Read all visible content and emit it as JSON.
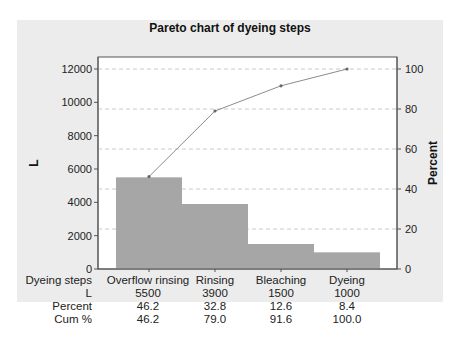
{
  "chart_data": {
    "type": "bar",
    "title": "Pareto chart of dyeing steps",
    "xlabel": "Dyeing steps",
    "ylabel": "L",
    "y2label": "Percent",
    "categories": [
      "Overflow rinsing",
      "Rinsing",
      "Bleaching",
      "Dyeing"
    ],
    "series": [
      {
        "name": "L",
        "type": "bar",
        "values": [
          5500,
          3900,
          1500,
          1000
        ]
      },
      {
        "name": "Cum %",
        "type": "line",
        "axis": "right",
        "values": [
          46.2,
          79.0,
          91.6,
          100.0
        ]
      }
    ],
    "ylim": [
      0,
      12000
    ],
    "y2lim": [
      0,
      100
    ],
    "yticks": [
      "0",
      "2000",
      "4000",
      "6000",
      "8000",
      "10000",
      "12000"
    ],
    "y2ticks": [
      "0",
      "20",
      "40",
      "60",
      "80",
      "100"
    ],
    "grid": "dashed horizontal at right-axis ticks",
    "table": {
      "row_headers": [
        "Dyeing steps",
        "L",
        "Percent",
        "Cum %"
      ],
      "rows": [
        [
          "Overflow rinsing",
          "Rinsing",
          "Bleaching",
          "Dyeing"
        ],
        [
          "5500",
          "3900",
          "1500",
          "1000"
        ],
        [
          "46.2",
          "32.8",
          "12.6",
          "8.4"
        ],
        [
          "46.2",
          "79.0",
          "91.6",
          "100.0"
        ]
      ]
    },
    "colors": {
      "bar": "#a6a6a6",
      "line": "#8c8c8c",
      "panel": "#ececec",
      "grid": "#bdbdbd"
    }
  }
}
